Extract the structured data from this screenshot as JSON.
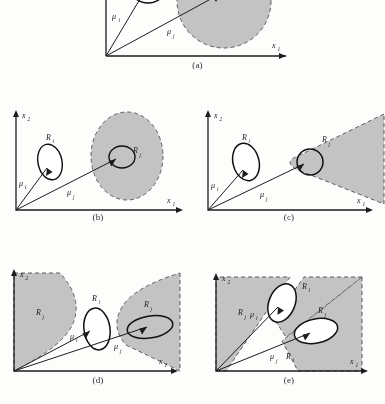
{
  "figure": {
    "kind": "multi-panel-line-diagram",
    "panel_count": 5,
    "shade_color": "#c3c3c3",
    "shade_color_dark": "#b4b4b4",
    "ink_color": "#1c1c1c",
    "page_background": "#fdfdfc"
  },
  "axes": {
    "x_label": "x",
    "x_sub": "1",
    "y_label": "x",
    "y_sub": "2"
  },
  "symbols": {
    "mu": "μ",
    "mu_i_sub": "i",
    "mu_j_sub": "j",
    "R": "R",
    "R_i_sub": "i",
    "R_j_sub": "j"
  },
  "panels": [
    {
      "id": "a",
      "caption": "(a)",
      "region_i_shape": "small-circle",
      "region_j_shape": "large-circle",
      "labels": [
        "μ i",
        "μ j",
        "x 1"
      ],
      "has_y_axis_label": false,
      "vectors": [
        "mu_i",
        "mu_j"
      ]
    },
    {
      "id": "b",
      "caption": "(b)",
      "region_i_shape": "small-ellipse",
      "region_j_shape": "large-ellipse",
      "labels": [
        "R i",
        "R j",
        "μ i",
        "μ j",
        "x 1",
        "x 2"
      ],
      "has_y_axis_label": true,
      "vectors": [
        "mu_i",
        "mu_j"
      ]
    },
    {
      "id": "c",
      "caption": "(c)",
      "region_i_shape": "small-ellipse",
      "region_j_shape": "cone-open-right",
      "labels": [
        "R i",
        "R j",
        "μ i",
        "μ j",
        "x 1",
        "x 2"
      ],
      "has_y_axis_label": true,
      "vectors": [
        "mu_i",
        "mu_j"
      ]
    },
    {
      "id": "d",
      "caption": "(d)",
      "region_i_shape": "small-ellipse",
      "region_j_shape": "two-cones-left-and-right",
      "labels": [
        "R j",
        "R i",
        "R j",
        "μ i",
        "μ j",
        "x 1",
        "x 2"
      ],
      "has_y_axis_label": true,
      "vectors": [
        "mu_i",
        "mu_j"
      ]
    },
    {
      "id": "e",
      "caption": "(e)",
      "region_i_shape": "tilted-ellipse",
      "region_j_shape": "crossed-wedges",
      "labels": [
        "R i",
        "R j",
        "R j",
        "μ i",
        "μ j",
        "R i",
        "x 1",
        "x 2"
      ],
      "has_y_axis_label": true,
      "vectors": [
        "mu_i",
        "mu_j"
      ]
    }
  ]
}
